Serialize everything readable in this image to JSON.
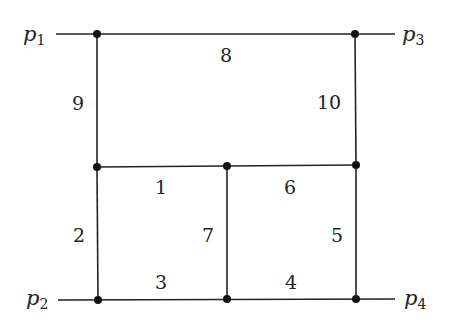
{
  "diagram": {
    "type": "two-loop double box graph",
    "external_legs": [
      {
        "name": "p",
        "sub": "1",
        "x": 34,
        "y": 40
      },
      {
        "name": "p",
        "sub": "3",
        "x": 402,
        "y": 40
      },
      {
        "name": "p",
        "sub": "2",
        "x": 30,
        "y": 305
      },
      {
        "name": "p",
        "sub": "4",
        "x": 405,
        "y": 305
      }
    ],
    "edge_labels": [
      {
        "text": "1",
        "x": 161,
        "y": 194
      },
      {
        "text": "2",
        "x": 79,
        "y": 242
      },
      {
        "text": "3",
        "x": 161,
        "y": 288
      },
      {
        "text": "4",
        "x": 291,
        "y": 288
      },
      {
        "text": "5",
        "x": 336,
        "y": 241
      },
      {
        "text": "6",
        "x": 290,
        "y": 193
      },
      {
        "text": "7",
        "x": 208,
        "y": 242
      },
      {
        "text": "8",
        "x": 226,
        "y": 61
      },
      {
        "text": "9",
        "x": 78,
        "y": 110
      },
      {
        "text": "10",
        "x": 331,
        "y": 108
      }
    ],
    "vertices": [
      {
        "x": 97,
        "y": 34
      },
      {
        "x": 355,
        "y": 34
      },
      {
        "x": 97,
        "y": 167
      },
      {
        "x": 227,
        "y": 166
      },
      {
        "x": 356,
        "y": 165
      },
      {
        "x": 98,
        "y": 300
      },
      {
        "x": 227,
        "y": 299
      },
      {
        "x": 356,
        "y": 299
      }
    ],
    "colors": {
      "line": "#222222",
      "background": "#ffffff"
    }
  }
}
